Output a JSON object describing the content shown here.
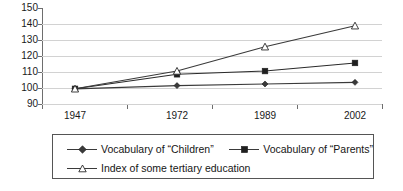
{
  "chart_data": {
    "type": "line",
    "title": "",
    "subtitle": "",
    "xlabel": "",
    "ylabel": "",
    "categories": [
      "1947",
      "1972",
      "1989",
      "2002"
    ],
    "x": [
      1947,
      1972,
      1989,
      2002
    ],
    "ylim": [
      90,
      150
    ],
    "yticks": [
      90,
      100,
      110,
      120,
      130,
      140,
      150
    ],
    "ytick_labels": [
      "90",
      "100",
      "110",
      "120",
      "130",
      "140",
      "150"
    ],
    "grid": "horizontal",
    "legend_position": "bottom",
    "series": [
      {
        "name": "Vocabulary of “Children”",
        "marker": "diamond-filled",
        "color": "#3a3a3a",
        "values": [
          100,
          102,
          103,
          104
        ]
      },
      {
        "name": "Vocabulary of “Parents”",
        "marker": "square-filled",
        "color": "#2a2a2a",
        "values": [
          100,
          109,
          111,
          116
        ]
      },
      {
        "name": "Index of some tertiary education",
        "marker": "triangle-hollow",
        "color": "#3a3a3a",
        "values": [
          100,
          111,
          126,
          139
        ]
      }
    ]
  },
  "axes": {
    "y_tick_labels": [
      "150",
      "140",
      "130",
      "120",
      "110",
      "100",
      "90"
    ],
    "x_tick_labels": [
      "1947",
      "1972",
      "1989",
      "2002"
    ]
  },
  "legend": {
    "items": [
      {
        "label": "Vocabulary of “Children”",
        "marker": "diamond-filled"
      },
      {
        "label": "Vocabulary of “Parents”",
        "marker": "square-filled"
      },
      {
        "label": "Index of some tertiary education",
        "marker": "triangle-hollow"
      }
    ]
  },
  "colors": {
    "axis": "#6e6e6e",
    "grid": "#d2d2d2",
    "series_1": "#3a3a3a",
    "series_2": "#2a2a2a",
    "series_3": "#3a3a3a",
    "legend_border": "#555555"
  }
}
